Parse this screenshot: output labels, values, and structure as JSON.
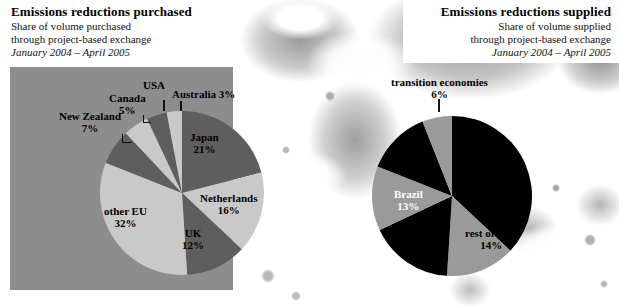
{
  "left_panel": {
    "title": "Emissions reductions purchased",
    "subtitle_line1": "Share of volume purchased",
    "subtitle_line2": "through project-based exchange",
    "dates": "January 2004 – April 2005"
  },
  "right_panel": {
    "title": "Emissions reductions supplied",
    "subtitle_line1": "Share of volume supplied",
    "subtitle_line2": "through project-based exchange",
    "dates": "January 2004 – April 2005"
  },
  "colors": {
    "panel_background": "#8d8d8d",
    "slice_dark": "#5e5e5e",
    "slice_light": "#c9c9c9",
    "slice_black": "#000000",
    "slice_gray": "#9a9a9a",
    "text": "#000000",
    "plate": "#ffffff"
  },
  "chart_data": [
    {
      "type": "pie",
      "id": "emissions-reductions-purchased",
      "title": "Emissions reductions purchased",
      "subtitle": "Share of volume purchased through project-based exchange",
      "period": "January 2004 – April 2005",
      "unit": "percent",
      "legend": "labels-on-chart",
      "categories": [
        "Japan",
        "Netherlands",
        "UK",
        "other EU",
        "New Zealand",
        "Canada",
        "USA",
        "Australia"
      ],
      "values": [
        21,
        16,
        12,
        32,
        7,
        5,
        4,
        3
      ],
      "labels": [
        {
          "name": "Japan",
          "value": 21,
          "text": "Japan",
          "pct": "21%",
          "fill": "#5e5e5e",
          "placement": "inside"
        },
        {
          "name": "Netherlands",
          "value": 16,
          "text": "Netherlands",
          "pct": "16%",
          "fill": "#c9c9c9",
          "placement": "inside"
        },
        {
          "name": "UK",
          "value": 12,
          "text": "UK",
          "pct": "12%",
          "fill": "#5e5e5e",
          "placement": "inside"
        },
        {
          "name": "other EU",
          "value": 32,
          "text": "other EU",
          "pct": "32%",
          "fill": "#c9c9c9",
          "placement": "inside"
        },
        {
          "name": "New Zealand",
          "value": 7,
          "text": "New Zealand",
          "pct": "7%",
          "fill": "#5e5e5e",
          "placement": "outside"
        },
        {
          "name": "Canada",
          "value": 5,
          "text": "Canada",
          "pct": "5%",
          "fill": "#c9c9c9",
          "placement": "outside"
        },
        {
          "name": "USA",
          "value": 4,
          "text": "USA",
          "pct": "4%",
          "fill": "#5e5e5e",
          "placement": "outside"
        },
        {
          "name": "Australia",
          "value": 3,
          "text": "Australia",
          "pct": "3%",
          "fill": "#c9c9c9",
          "placement": "outside"
        }
      ]
    },
    {
      "type": "pie",
      "id": "emissions-reductions-supplied",
      "title": "Emissions reductions supplied",
      "subtitle": "Share of volume supplied through project-based exchange",
      "period": "January 2004 – April 2005",
      "unit": "percent",
      "legend": "labels-on-chart",
      "categories": [
        "unlabelled-major",
        "rest of Asia",
        "unlabelled-second",
        "Brazil",
        "unlabelled-third",
        "transition economies"
      ],
      "values": [
        37,
        14,
        17,
        13,
        13,
        6
      ],
      "labels": [
        {
          "name": "transition economies",
          "value": 6,
          "text": "transition economies",
          "pct": "6%",
          "fill": "#9a9a9a",
          "placement": "outside"
        },
        {
          "name": "Brazil",
          "value": 13,
          "text": "Brazil",
          "pct": "13%",
          "fill": "#9a9a9a",
          "placement": "inside"
        },
        {
          "name": "rest of Asia",
          "value": 14,
          "text": "rest of Asia",
          "pct": "14%",
          "fill": "#9a9a9a",
          "placement": "inside"
        }
      ]
    }
  ],
  "left_labels": {
    "japan": {
      "text": "Japan",
      "pct": "21%"
    },
    "netherlands": {
      "text": "Netherlands",
      "pct": "16%"
    },
    "uk": {
      "text": "UK",
      "pct": "12%"
    },
    "other_eu": {
      "text": "other EU",
      "pct": "32%"
    },
    "new_zealand": {
      "text": "New Zealand",
      "pct": "7%"
    },
    "canada": {
      "text": "Canada",
      "pct": "5%"
    },
    "usa": {
      "text": "USA",
      "pct": "4%"
    },
    "australia": {
      "text": "Australia 3%"
    }
  },
  "right_labels": {
    "transition": {
      "text": "transition economies",
      "pct": "6%"
    },
    "brazil": {
      "text": "Brazil",
      "pct": "13%"
    },
    "rest_of_asia": {
      "text": "rest of Asia",
      "pct": "14%"
    }
  }
}
